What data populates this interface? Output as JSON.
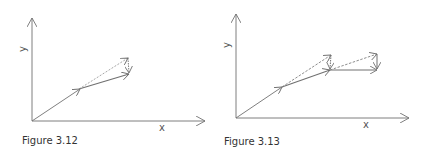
{
  "figures": [
    {
      "id": "fig-3-12",
      "caption": "Figure 3.12",
      "x_axis_label": "x",
      "y_axis_label": "y"
    },
    {
      "id": "fig-3-13",
      "caption": "Figure 3.13",
      "x_axis_label": "x",
      "y_axis_label": "y"
    }
  ],
  "colors": {
    "line": "#707070",
    "dashed": "#808080",
    "text": "#444444"
  }
}
